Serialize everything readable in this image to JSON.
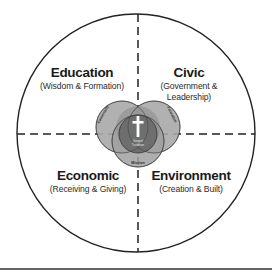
{
  "quadrants": {
    "top_left": {
      "title": "Education",
      "subtitle": "(Wisdom & Formation)"
    },
    "top_right": {
      "title": "Civic",
      "subtitle_line1": "(Government &",
      "subtitle_line2": "Leadership)"
    },
    "bottom_left": {
      "title": "Economic",
      "subtitle": "(Receiving & Giving)"
    },
    "bottom_right": {
      "title": "Environment",
      "subtitle": "(Creation & Built)"
    }
  },
  "core": {
    "left_circle_label": "Community",
    "right_circle_label": "Formation",
    "bottom_circle_label": "Mission",
    "center_label_line1": "Gospel",
    "center_label_line2": "Tradition",
    "center_icon": "cross-icon"
  },
  "colors": {
    "outer_stroke": "#222222",
    "light_circle": "#a9a9a9",
    "mid_circle": "#8a8a8a",
    "center_circle": "#6e6e6e",
    "cross": "#ffffff"
  }
}
